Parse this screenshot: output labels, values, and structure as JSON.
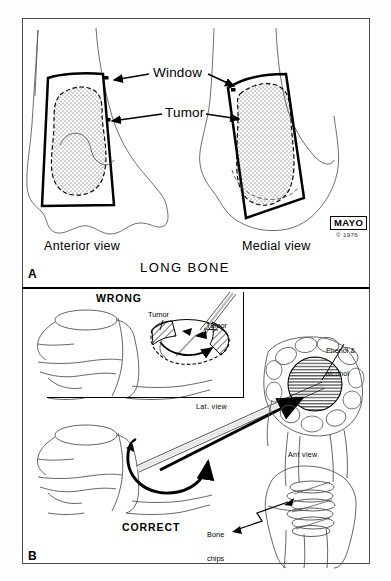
{
  "figure": {
    "background_color": "#ffffff",
    "frame_color": "#4a4a4a",
    "ink_color": "#000000"
  },
  "panel_a": {
    "letter": "A",
    "title": "LONG BONE",
    "labels": {
      "window": "Window",
      "tumor": "Tumor"
    },
    "views": [
      {
        "caption": "Anterior view"
      },
      {
        "caption": "Medial view"
      }
    ],
    "credit": {
      "mark": "MAYO",
      "copyright": "© 1976"
    }
  },
  "panel_b": {
    "letter": "B",
    "headings": {
      "wrong": "WRONG",
      "correct": "CORRECT"
    },
    "labels": {
      "tumor_left": "Tumor",
      "tumor_right": "Tumor",
      "lateral_view": "Lat. view",
      "anterior_view": "Ant view",
      "phenol_line1": "Phenol &",
      "phenol_line2": "alcohol",
      "bone_chips_line1": "Bone",
      "bone_chips_line2": "chips"
    }
  }
}
